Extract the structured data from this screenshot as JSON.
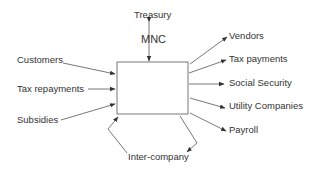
{
  "diagram": {
    "center": {
      "label": "MNC"
    },
    "top": {
      "label": "Treasury"
    },
    "inflows": [
      {
        "label": "Customers"
      },
      {
        "label": "Tax repayments"
      },
      {
        "label": "Subsidies"
      }
    ],
    "outflows": [
      {
        "label": "Vendors"
      },
      {
        "label": "Tax payments"
      },
      {
        "label": "Social Security"
      },
      {
        "label": "Utility Companies"
      },
      {
        "label": "Payroll"
      }
    ],
    "bottom": {
      "label": "Inter-company"
    },
    "colors": {
      "line": "#555555",
      "text": "#333333",
      "background": "#ffffff"
    }
  }
}
